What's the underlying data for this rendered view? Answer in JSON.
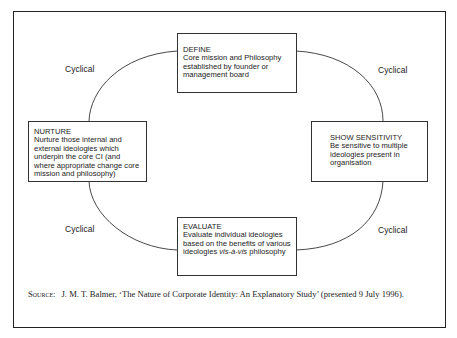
{
  "diagram": {
    "nodes": {
      "define": {
        "title": "DEFINE",
        "body": "Core mission and Philosophy established by founder or management board"
      },
      "nurture": {
        "title": "NURTURE",
        "body": "Nurture those internal and external ideologies which underpin the core CI (and where appropriate change core mission and philosophy)"
      },
      "show_sensitivity": {
        "title": "SHOW SENSITIVITY",
        "body": "Be sensitive to multiple ideologies present in organisation"
      },
      "evaluate": {
        "title": "EVALUATE",
        "body_plain": "Evaluate individual ideologies based on the benefits of various ideologies ",
        "body_italic": "vis-à-vis",
        "body_tail": " philosophy"
      }
    },
    "edge_labels": {
      "top_left": "Cyclical",
      "top_right": "Cyclical",
      "bottom_left": "Cyclical",
      "bottom_right": "Cyclical"
    }
  },
  "source": {
    "label": "Source:",
    "text": "J. M. T. Balmer, ‘The Nature of Corporate Identity: An Explanatory Study’ (presented 9 July 1996)."
  }
}
